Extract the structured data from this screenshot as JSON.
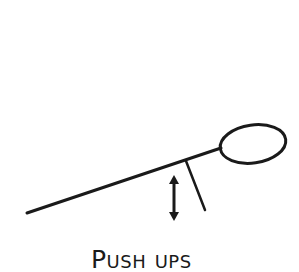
{
  "diagram": {
    "caption": "Push ups",
    "stroke_color": "#1a1a1a",
    "background": "#ffffff",
    "elements": {
      "head": {
        "cx": 253,
        "cy": 144,
        "rx": 33,
        "ry": 19,
        "rotate": -8
      },
      "body": {
        "x1": 27,
        "y1": 213,
        "x2": 220,
        "y2": 149
      },
      "arm": {
        "x1": 186,
        "y1": 161,
        "x2": 205,
        "y2": 210
      },
      "motion_arrow": {
        "x": 174,
        "y1": 176,
        "y2": 220,
        "direction": "up-down"
      }
    }
  }
}
